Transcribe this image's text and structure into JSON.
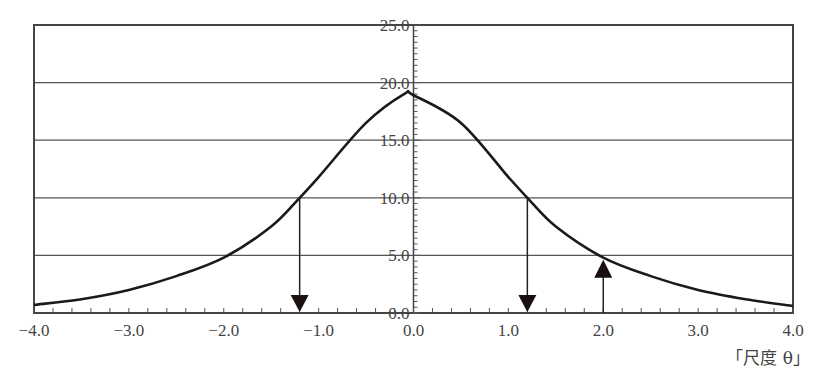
{
  "chart_data": {
    "type": "line",
    "title": "",
    "xlabel": "「尺度 θ」",
    "ylabel": "",
    "xlim": [
      -4.0,
      4.0
    ],
    "ylim": [
      0.0,
      25.0
    ],
    "x_ticks": [
      "−4.0",
      "−3.0",
      "−2.0",
      "−1.0",
      "0.0",
      "1.0",
      "2.0",
      "3.0",
      "4.0"
    ],
    "x_tick_values": [
      -4,
      -3,
      -2,
      -1,
      0,
      1,
      2,
      3,
      4
    ],
    "y_ticks": [
      "0.0",
      "5.0",
      "10.0",
      "15.0",
      "20.0",
      "25.0"
    ],
    "y_tick_values": [
      0,
      5,
      10,
      15,
      20,
      25
    ],
    "grid": "horizontal",
    "series": [
      {
        "name": "curve",
        "x": [
          -4.0,
          -3.5,
          -3.0,
          -2.5,
          -2.0,
          -1.5,
          -1.2,
          -1.0,
          -0.5,
          -0.1,
          0.0,
          0.5,
          1.0,
          1.2,
          1.5,
          2.0,
          2.5,
          3.0,
          3.5,
          4.0
        ],
        "values": [
          0.7,
          1.2,
          2.0,
          3.2,
          4.8,
          7.5,
          10.0,
          11.8,
          16.5,
          19.0,
          18.9,
          16.5,
          11.8,
          10.0,
          7.5,
          4.8,
          3.2,
          2.0,
          1.2,
          0.6
        ]
      }
    ],
    "annotations": [
      {
        "type": "arrow-down",
        "x": -1.2,
        "from_y": 10.0,
        "to_y": 0.0
      },
      {
        "type": "arrow-down",
        "x": 1.2,
        "from_y": 10.0,
        "to_y": 0.0
      },
      {
        "type": "arrow-up",
        "x": 2.0,
        "from_y": 0.0,
        "to_y": 4.8
      }
    ]
  },
  "axis": {
    "x_title": "「尺度 θ」"
  },
  "colors": {
    "line": "#1a1a1a",
    "grid": "#555555",
    "frame": "#444444"
  }
}
